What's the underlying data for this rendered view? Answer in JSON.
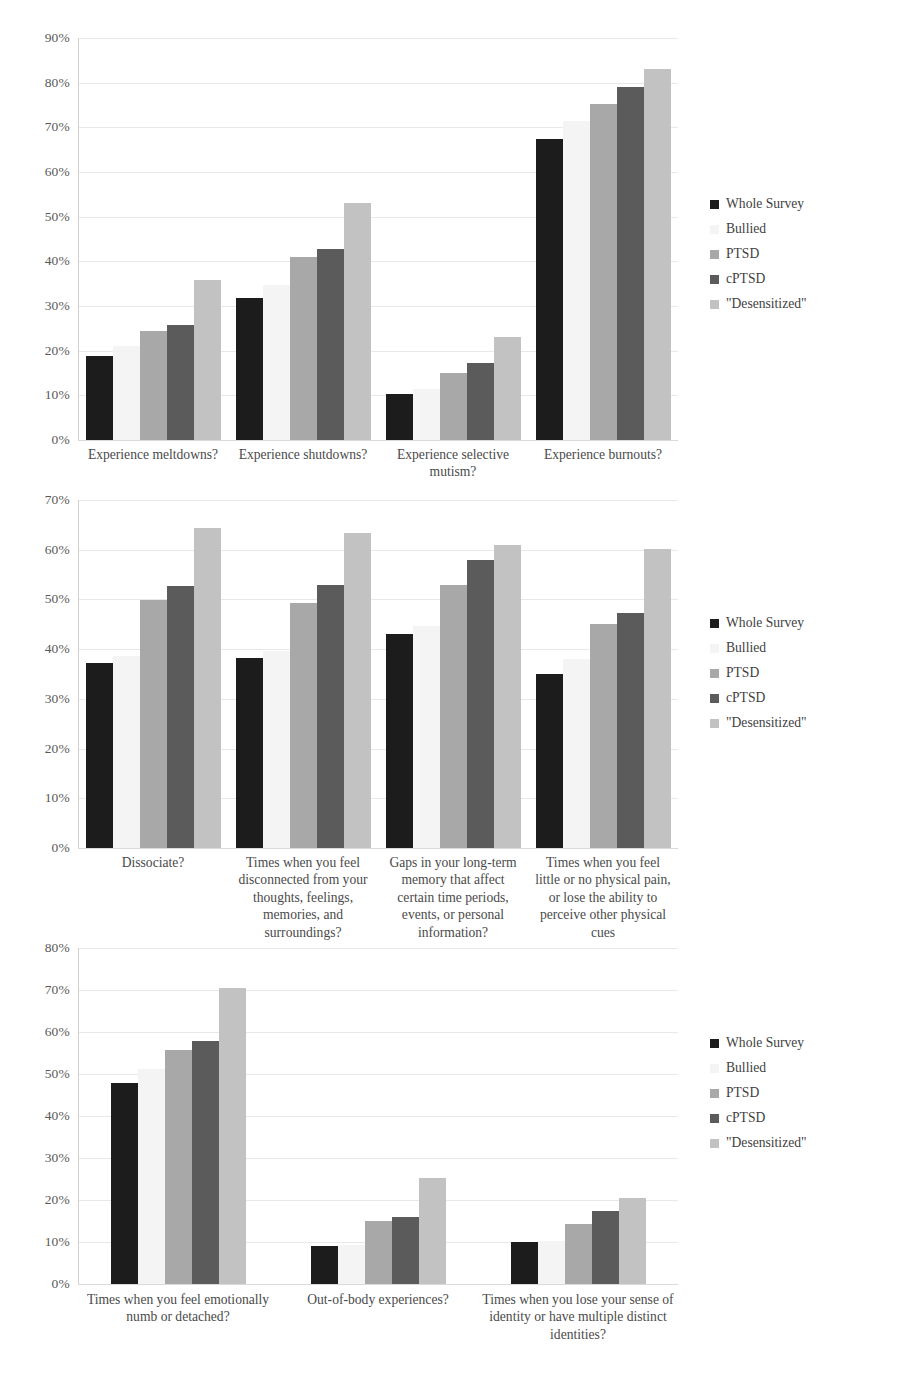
{
  "series": [
    {
      "name": "Whole Survey",
      "color": "#1c1c1c"
    },
    {
      "name": "Bullied",
      "color": "#f4f4f4"
    },
    {
      "name": "PTSD",
      "color": "#a8a8a8"
    },
    {
      "name": "cPTSD",
      "color": "#5b5b5b"
    },
    {
      "name": "\"Desensitized\"",
      "color": "#c2c2c2"
    }
  ],
  "legend_labels": [
    "Whole Survey",
    "Bullied",
    "PTSD",
    "cPTSD",
    "\"Desensitized\""
  ],
  "chart_data": [
    {
      "type": "bar",
      "title": "",
      "xlabel": "",
      "ylabel": "",
      "ylim": [
        0,
        90
      ],
      "ytick_labels": [
        "0%",
        "10%",
        "20%",
        "30%",
        "40%",
        "50%",
        "60%",
        "70%",
        "80%",
        "90%"
      ],
      "ytick_values": [
        0,
        10,
        20,
        30,
        40,
        50,
        60,
        70,
        80,
        90
      ],
      "grid": true,
      "legend_position": "right",
      "categories": [
        "Experience meltdowns?",
        "Experience shutdowns?",
        "Experience selective mutism?",
        "Experience burnouts?"
      ],
      "series": [
        {
          "name": "Whole Survey",
          "values": [
            18.7,
            31.8,
            10.3,
            67.3
          ]
        },
        {
          "name": "Bullied",
          "values": [
            21.0,
            34.8,
            11.5,
            71.5
          ]
        },
        {
          "name": "PTSD",
          "values": [
            24.5,
            41.0,
            15.0,
            75.2
          ]
        },
        {
          "name": "cPTSD",
          "values": [
            25.8,
            42.8,
            17.2,
            79.1
          ]
        },
        {
          "name": "\"Desensitized\"",
          "values": [
            35.8,
            53.0,
            23.0,
            83.0
          ]
        }
      ]
    },
    {
      "type": "bar",
      "title": "",
      "xlabel": "",
      "ylabel": "",
      "ylim": [
        0,
        70
      ],
      "ytick_labels": [
        "0%",
        "10%",
        "20%",
        "30%",
        "40%",
        "50%",
        "60%",
        "70%"
      ],
      "ytick_values": [
        0,
        10,
        20,
        30,
        40,
        50,
        60,
        70
      ],
      "grid": true,
      "legend_position": "right",
      "categories": [
        "Dissociate?",
        "Times when you feel disconnected from your thoughts, feelings, memories, and surroundings?",
        "Gaps in your long-term memory that affect certain time periods, events, or personal information?",
        "Times when you feel little or no physical pain, or lose the ability to perceive other physical cues"
      ],
      "series": [
        {
          "name": "Whole Survey",
          "values": [
            37.2,
            38.2,
            43.0,
            35.0
          ]
        },
        {
          "name": "Bullied",
          "values": [
            38.6,
            39.6,
            44.6,
            38.0
          ]
        },
        {
          "name": "PTSD",
          "values": [
            49.8,
            49.2,
            53.0,
            45.0
          ]
        },
        {
          "name": "cPTSD",
          "values": [
            52.8,
            53.0,
            58.0,
            47.2
          ]
        },
        {
          "name": "\"Desensitized\"",
          "values": [
            64.3,
            63.3,
            61.0,
            60.2
          ]
        }
      ]
    },
    {
      "type": "bar",
      "title": "",
      "xlabel": "",
      "ylabel": "",
      "ylim": [
        0,
        80
      ],
      "ytick_labels": [
        "0%",
        "10%",
        "20%",
        "30%",
        "40%",
        "50%",
        "60%",
        "70%",
        "80%"
      ],
      "ytick_values": [
        0,
        10,
        20,
        30,
        40,
        50,
        60,
        70,
        80
      ],
      "grid": true,
      "legend_position": "right",
      "categories": [
        "Times when you feel emotionally numb or detached?",
        "Out-of-body experiences?",
        "Times when you lose your sense of identity or have multiple distinct identities?"
      ],
      "series": [
        {
          "name": "Whole Survey",
          "values": [
            47.8,
            9.0,
            10.0
          ]
        },
        {
          "name": "Bullied",
          "values": [
            51.2,
            9.4,
            10.2
          ]
        },
        {
          "name": "PTSD",
          "values": [
            55.8,
            15.0,
            14.2
          ]
        },
        {
          "name": "cPTSD",
          "values": [
            57.8,
            16.0,
            17.4
          ]
        },
        {
          "name": "\"Desensitized\"",
          "values": [
            70.5,
            25.2,
            20.5
          ]
        }
      ]
    }
  ]
}
